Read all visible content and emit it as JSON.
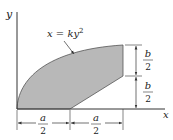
{
  "diagram": {
    "axis_labels": {
      "x": "x",
      "y": "y"
    },
    "curve_label": {
      "lhs": "x",
      "eq": " = ",
      "k": "k",
      "var": "y",
      "exp": "2"
    },
    "dimensions": {
      "top_right": {
        "num": "b",
        "den": "2"
      },
      "bottom_right": {
        "num": "b",
        "den": "2"
      },
      "bottom_left": {
        "num": "a",
        "den": "2"
      },
      "bottom_mid": {
        "num": "a",
        "den": "2"
      }
    },
    "colors": {
      "fill": "#b8b8b8",
      "stroke": "#555555",
      "line": "#333333"
    }
  }
}
